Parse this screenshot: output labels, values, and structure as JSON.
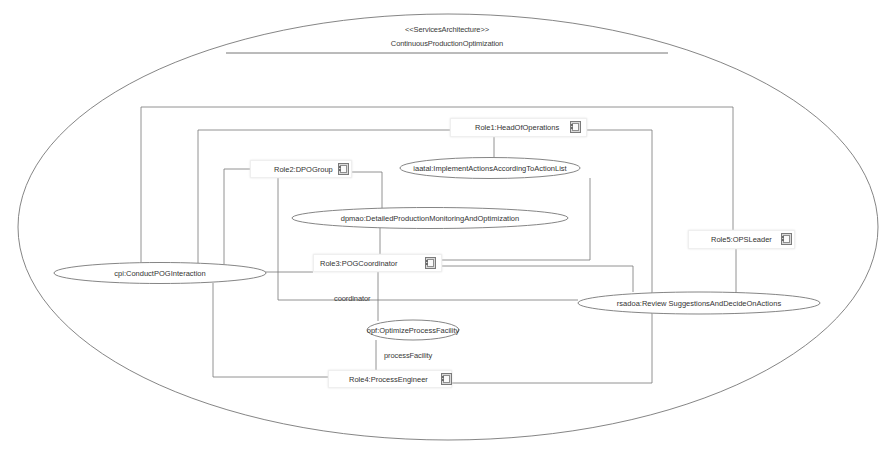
{
  "diagram": {
    "stereotype": "<<ServicesArchitecture>>",
    "title": "ContinuousProductionOptimization",
    "colors": {
      "line": "#777777",
      "text": "#333333",
      "background": "#ffffff"
    },
    "roles": [
      {
        "id": "role1",
        "label": "Role1:HeadOfOperations"
      },
      {
        "id": "role2",
        "label": "Role2:DPOGroup"
      },
      {
        "id": "role3",
        "label": "Role3:POGCoordinator"
      },
      {
        "id": "role4",
        "label": "Role4:ProcessEngineer"
      },
      {
        "id": "role5",
        "label": "Role5:OPSLeader"
      }
    ],
    "collaborations": [
      {
        "id": "iaatal",
        "label": "iaatal:ImplementActionsAccordingToActionList"
      },
      {
        "id": "dpmao",
        "label": "dpmao:DetailedProductionMonitoringAndOptimization"
      },
      {
        "id": "cpi",
        "label": "cpi:ConductPOGInteraction"
      },
      {
        "id": "rsadoa",
        "label": "rsadoa:Review SuggestionsAndDecideOnActions"
      },
      {
        "id": "opf",
        "label": "opf:OptimizeProcessFacility"
      }
    ],
    "connector_labels": {
      "coordinator": "coordinator",
      "processFacility": "processFacility"
    },
    "role_icon": "classifier-structure-icon"
  }
}
